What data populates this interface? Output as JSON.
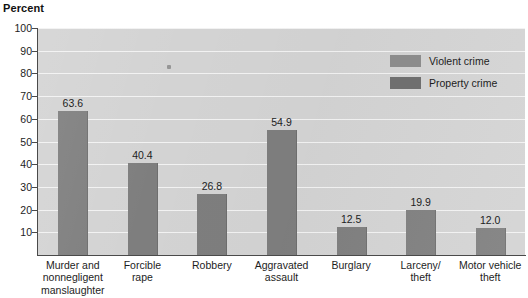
{
  "chart_data": {
    "type": "bar",
    "title": "",
    "ylabel": "Percent",
    "xlabel": "",
    "ylim": [
      0,
      100
    ],
    "ytick_step": 10,
    "ytick_labels": [
      "100",
      "90",
      "80",
      "70",
      "60",
      "50",
      "40",
      "30",
      "20",
      "10"
    ],
    "grid": true,
    "legend_position": "top-right",
    "categories": [
      "Murder and\nnonnegligent\nmanslaughter",
      "Forcible\nrape",
      "Robbery",
      "Aggravated\nassault",
      "Burglary",
      "Larceny/\ntheft",
      "Motor vehicle\ntheft"
    ],
    "category_lines": [
      [
        "Murder and",
        "nonnegligent",
        "manslaughter"
      ],
      [
        "Forcible",
        "rape"
      ],
      [
        "Robbery"
      ],
      [
        "Aggravated",
        "assault"
      ],
      [
        "Burglary"
      ],
      [
        "Larceny/",
        "theft"
      ],
      [
        "Motor vehicle",
        "theft"
      ]
    ],
    "values": [
      63.6,
      40.4,
      26.8,
      54.9,
      12.5,
      19.9,
      12.0
    ],
    "value_labels": [
      "63.6",
      "40.4",
      "26.8",
      "54.9",
      "12.5",
      "19.9",
      "12.0"
    ],
    "series_of_category": [
      "violent",
      "violent",
      "violent",
      "violent",
      "property",
      "property",
      "property"
    ],
    "legend": [
      {
        "key": "violent",
        "label": "Violent crime",
        "color": "#8c8c8c"
      },
      {
        "key": "property",
        "label": "Property crime",
        "color": "#6f6f6f"
      }
    ],
    "bar_color": "#7e7e7e",
    "plot_background": "#d3d3d3",
    "gridline_color": "#f2f2f2",
    "axis_color": "#4a4a4a"
  }
}
